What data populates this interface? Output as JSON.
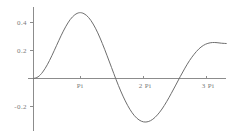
{
  "chart_data": {
    "type": "line",
    "title": "",
    "subtitle": "",
    "xlabel": "",
    "ylabel": "",
    "grid": false,
    "legend": false,
    "legend_position": "none",
    "xlim": [
      0,
      10.5
    ],
    "ylim": [
      -0.36,
      0.52
    ],
    "x_tick_values": [
      3.14159,
      6.28319,
      9.42478
    ],
    "x_tick_labels": [
      "Pi",
      "2 Pi",
      "3 Pi"
    ],
    "y_tick_values": [
      -0.2,
      0.2,
      0.4
    ],
    "y_tick_labels": [
      "-0.2",
      "0.2",
      "0.4"
    ],
    "series": [
      {
        "name": "curve",
        "color": "#6e6e6e",
        "x": [
          0.0,
          0.25,
          0.5,
          0.75,
          1.0,
          1.25,
          1.5,
          1.75,
          2.0,
          2.25,
          2.5,
          2.75,
          3.0,
          3.25,
          3.5,
          3.75,
          4.0,
          4.25,
          4.5,
          4.75,
          5.0,
          5.25,
          5.5,
          5.75,
          6.0,
          6.25,
          6.5,
          6.75,
          7.0,
          7.25,
          7.5,
          7.75,
          8.0,
          8.25,
          8.5,
          8.75,
          9.0,
          9.25,
          9.5,
          9.75,
          10.0,
          10.25,
          10.5
        ],
        "y": [
          0.0,
          0.012,
          0.046,
          0.098,
          0.163,
          0.234,
          0.305,
          0.369,
          0.421,
          0.455,
          0.47,
          0.463,
          0.436,
          0.389,
          0.326,
          0.25,
          0.166,
          0.079,
          -0.008,
          -0.089,
          -0.16,
          -0.22,
          -0.266,
          -0.296,
          -0.31,
          -0.308,
          -0.291,
          -0.26,
          -0.218,
          -0.166,
          -0.108,
          -0.047,
          0.015,
          0.074,
          0.128,
          0.173,
          0.21,
          0.236,
          0.251,
          0.257,
          0.256,
          0.252,
          0.25
        ]
      }
    ],
    "annotations": {
      "peak_value": 0.47,
      "peak_x": 2.5,
      "trough_value": -0.31,
      "trough_x": 6.1,
      "zero_crossings": [
        0.0,
        4.48,
        7.9
      ],
      "end_value": 0.25
    }
  },
  "axes": {
    "axis_color": "#8c8c8c",
    "curve_color": "#6e6e6e",
    "label_color": "#7a7a7a",
    "background": "#ffffff"
  }
}
